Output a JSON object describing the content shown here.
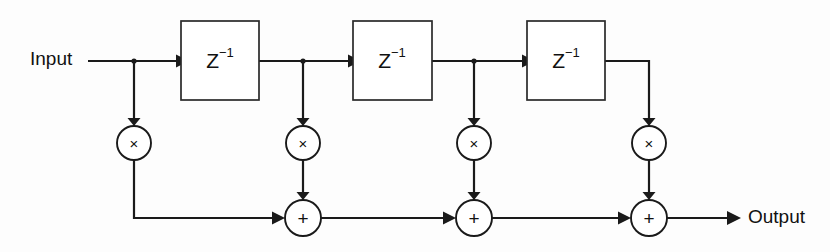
{
  "diagram": {
    "background_color": "#fdfdfd",
    "line_color": "#1a1a1a",
    "io": {
      "input_label": "Input",
      "output_label": "Output"
    },
    "delay_blocks": [
      {
        "id": "delay-1",
        "label_base": "Z",
        "label_exponent": "−1",
        "x": 181,
        "y": 21,
        "width": 78,
        "height": 79
      },
      {
        "id": "delay-2",
        "label_base": "Z",
        "label_exponent": "−1",
        "x": 353,
        "y": 21,
        "width": 79,
        "height": 79
      },
      {
        "id": "delay-3",
        "label_base": "Z",
        "label_exponent": "−1",
        "x": 527,
        "y": 21,
        "width": 78,
        "height": 79
      }
    ],
    "multipliers": [
      {
        "id": "multiplier-1",
        "glyph": "×",
        "cx": 134,
        "cy": 143,
        "r": 17
      },
      {
        "id": "multiplier-2",
        "glyph": "×",
        "cx": 303,
        "cy": 143,
        "r": 17
      },
      {
        "id": "multiplier-3",
        "glyph": "×",
        "cx": 474,
        "cy": 143,
        "r": 17
      },
      {
        "id": "multiplier-4",
        "glyph": "×",
        "cx": 649,
        "cy": 143,
        "r": 17
      }
    ],
    "adders": [
      {
        "id": "adder-1",
        "glyph": "+",
        "cx": 303,
        "cy": 218,
        "r": 18
      },
      {
        "id": "adder-2",
        "glyph": "+",
        "cx": 474,
        "cy": 218,
        "r": 18
      },
      {
        "id": "adder-3",
        "glyph": "+",
        "cx": 649,
        "cy": 218,
        "r": 18
      }
    ],
    "signal_rows": {
      "delay_line_y": 61,
      "multiplier_row_y": 143,
      "adder_row_y": 218
    },
    "input_line": {
      "start_x": 88,
      "y": 61,
      "tap_x": 134
    },
    "output_line": {
      "start_x": 667,
      "y": 218,
      "arrow_tip_x": 740
    }
  }
}
